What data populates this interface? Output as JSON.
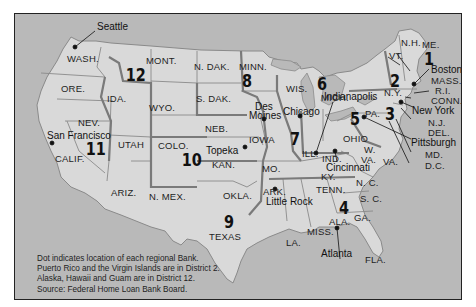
{
  "map": {
    "title": "Federal Home Loan Bank Districts",
    "colors": {
      "background": "#ffffff",
      "water_and_foreign": "#b9b9b9",
      "land": "#d9d9d9",
      "state_border": "#8a8a8a",
      "district_border": "#7a7a7a",
      "text": "#1e1e1e",
      "frame": "#222222"
    },
    "states": {
      "wash": "WASH.",
      "ore": "ORE.",
      "calif": "CALIF.",
      "nev": "NEV.",
      "ida": "IDA.",
      "mont": "MONT.",
      "wyo": "WYO.",
      "utah": "UTAH",
      "ariz": "ARIZ.",
      "colo": "COLO.",
      "nmex": "N. MEX.",
      "ndak": "N. DAK.",
      "sdak": "S. DAK.",
      "neb": "NEB.",
      "kan": "KAN.",
      "okla": "OKLA.",
      "texas": "TEXAS",
      "minn": "MINN.",
      "iowa": "IOWA",
      "mo": "MO.",
      "ark": "ARK.",
      "la": "LA.",
      "wis": "WIS.",
      "ill": "ILL.",
      "mich": "MICH.",
      "ind": "IND.",
      "ohio": "OHIO",
      "ky": "KY.",
      "tenn": "TENN.",
      "miss": "MISS.",
      "ala": "ALA.",
      "ga": "GA.",
      "fla": "FLA.",
      "sc": "S. C.",
      "nc": "N. C.",
      "va": "VA.",
      "wva_1": "W.",
      "wva_2": "VA.",
      "pa": "PA.",
      "ny": "N.Y.",
      "vt": "VT.",
      "nh": "N.H.",
      "me": "ME.",
      "mass": "MASS.",
      "ri": "R.I.",
      "conn": "CONN.",
      "nj": "N.J.",
      "del": "DEL.",
      "md": "MD.",
      "dc": "D.C."
    },
    "districts": [
      "1",
      "2",
      "3",
      "4",
      "5",
      "6",
      "7",
      "8",
      "9",
      "10",
      "11",
      "12"
    ],
    "cities": {
      "seattle": "Seattle",
      "san_francisco": "San Francisco",
      "topeka": "Topeka",
      "des_moines_1": "Des",
      "des_moines_2": "Moines",
      "chicago": "Chicago",
      "indianapolis": "Indianapolis",
      "cincinnati": "Cincinnati",
      "pittsburgh": "Pittsburgh",
      "new_york": "New York",
      "boston": "Boston",
      "atlanta": "Atlanta",
      "little_rock": "Little Rock"
    },
    "notes": [
      "Dot indicates location of each regional Bank.",
      "Puerto Rico and the Virgin Islands are in District 2.",
      "Alaska, Hawaii and Guam are in District 12.",
      "Source: Federal Home Loan Bank Board."
    ]
  }
}
